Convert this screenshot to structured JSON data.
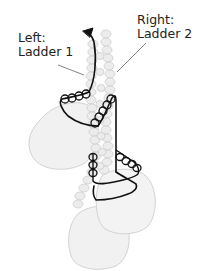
{
  "diagram": {
    "type": "beading-ladder-diagram",
    "labels": {
      "left": {
        "line1": "Left:",
        "line2": "Ladder 1"
      },
      "right": {
        "line1": "Right:",
        "line2": "Ladder 2"
      }
    },
    "colors": {
      "background": "#ffffff",
      "bead_fill": "#eeeeee",
      "bead_stroke": "#cfcfcf",
      "drop_fill": "#f0f0f0",
      "drop_stroke": "#d4d4d4",
      "thread": "#111111",
      "leader_line": "#666666",
      "text": "#222222"
    },
    "elements": {
      "drops": 3,
      "thread_arrow": "up-left arrowhead at top of ladder 1",
      "outlined_bead_groups": [
        "upper-left horizontal group (4)",
        "center diagonal group (5)",
        "lower-left vertical group (3)",
        "lower-right diagonal group (4)"
      ]
    }
  }
}
